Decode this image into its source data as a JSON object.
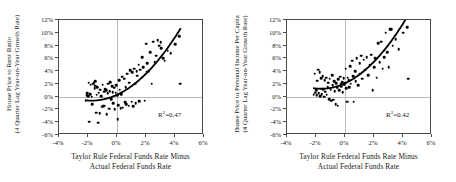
{
  "figure": {
    "background": "#ffffff",
    "point_color": "#000000",
    "curve_color": "#000000",
    "grid_color": "#b9b9b9",
    "frame_color": "#4a4a4a"
  },
  "charts": [
    {
      "id": "house-price-to-rent-ratio",
      "type": "scatter",
      "title": "",
      "ylabel_line1": "House Price to Rent Ratio",
      "ylabel_line2": "(4 Quarter Lag Year-on-Year Growth Rate)",
      "xlabel_line1": "Taylor Rule Federal Funds Rate Minus",
      "xlabel_line2": "Actual Federal Funds Rate",
      "xlim": [
        -4,
        6
      ],
      "ylim": [
        -6,
        12
      ],
      "xticks": [
        "-4%",
        "-2%",
        "0%",
        "2%",
        "4%",
        "6%"
      ],
      "xtick_values": [
        -4,
        -2,
        0,
        2,
        4,
        6
      ],
      "yticks": [
        "12%",
        "10%",
        "8%",
        "6%",
        "4%",
        "2%",
        "0%",
        "-2%",
        "-4%",
        "-6%"
      ],
      "ytick_values": [
        12,
        10,
        8,
        6,
        4,
        2,
        0,
        -2,
        -4,
        -6
      ],
      "grid": "zero-lines-only",
      "annotation": "R",
      "annotation_sup": "2",
      "annotation_value": "=0.47",
      "fit": {
        "type": "quadratic",
        "a": 0.3,
        "b": 1.05,
        "c": 0.3,
        "x_start": -2.2,
        "x_end": 4.4
      },
      "points": [
        [
          -2.15,
          -0.6
        ],
        [
          -2.1,
          0.2
        ],
        [
          -2.05,
          0.5
        ],
        [
          -2.0,
          0.1
        ],
        [
          -1.95,
          2.2
        ],
        [
          -1.9,
          -3.9
        ],
        [
          -1.85,
          0.4
        ],
        [
          -1.8,
          1.9
        ],
        [
          -1.75,
          0.0
        ],
        [
          -1.7,
          -1.2
        ],
        [
          -1.65,
          2.0
        ],
        [
          -1.6,
          2.1
        ],
        [
          -1.55,
          1.3
        ],
        [
          -1.5,
          2.4
        ],
        [
          -1.5,
          1.7
        ],
        [
          -1.45,
          -2.5
        ],
        [
          -1.4,
          0.3
        ],
        [
          -1.35,
          1.5
        ],
        [
          -1.3,
          -4.1
        ],
        [
          -1.25,
          0.6
        ],
        [
          -1.2,
          -2.6
        ],
        [
          -1.15,
          1.1
        ],
        [
          -1.1,
          0.1
        ],
        [
          -1.05,
          -1.6
        ],
        [
          -1.0,
          1.9
        ],
        [
          -0.95,
          -1.5
        ],
        [
          -0.9,
          0.8
        ],
        [
          -0.85,
          -1.4
        ],
        [
          -0.8,
          1.2
        ],
        [
          -0.75,
          1.0
        ],
        [
          -0.7,
          -2.7
        ],
        [
          -0.65,
          0.5
        ],
        [
          -0.6,
          2.0
        ],
        [
          -0.55,
          -1.9
        ],
        [
          -0.5,
          0.9
        ],
        [
          -0.45,
          2.3
        ],
        [
          -0.4,
          -0.4
        ],
        [
          -0.35,
          1.6
        ],
        [
          -0.3,
          0.7
        ],
        [
          -0.25,
          -1.0
        ],
        [
          -0.2,
          1.4
        ],
        [
          -0.15,
          -2.0
        ],
        [
          -0.1,
          0.6
        ],
        [
          -0.05,
          1.8
        ],
        [
          0.0,
          0.2
        ],
        [
          0.05,
          -3.5
        ],
        [
          0.1,
          -1.3
        ],
        [
          0.15,
          2.6
        ],
        [
          0.2,
          1.1
        ],
        [
          0.25,
          -1.8
        ],
        [
          0.3,
          0.4
        ],
        [
          0.35,
          3.1
        ],
        [
          0.4,
          -1.7
        ],
        [
          0.5,
          2.8
        ],
        [
          0.55,
          -0.9
        ],
        [
          0.6,
          1.5
        ],
        [
          0.65,
          -1.2
        ],
        [
          0.7,
          3.6
        ],
        [
          0.8,
          -1.4
        ],
        [
          0.85,
          2.2
        ],
        [
          0.9,
          4.1
        ],
        [
          1.0,
          -0.8
        ],
        [
          1.05,
          3.8
        ],
        [
          1.1,
          -1.5
        ],
        [
          1.2,
          4.4
        ],
        [
          1.25,
          2.0
        ],
        [
          1.3,
          -1.0
        ],
        [
          1.35,
          4.0
        ],
        [
          1.4,
          3.3
        ],
        [
          1.5,
          5.0
        ],
        [
          1.55,
          -0.7
        ],
        [
          1.6,
          4.2
        ],
        [
          1.7,
          3.0
        ],
        [
          1.75,
          6.2
        ],
        [
          1.8,
          4.6
        ],
        [
          1.9,
          -0.6
        ],
        [
          2.0,
          8.3
        ],
        [
          2.05,
          3.9
        ],
        [
          2.1,
          5.2
        ],
        [
          2.2,
          4.0
        ],
        [
          2.3,
          7.0
        ],
        [
          2.4,
          2.0
        ],
        [
          2.5,
          8.6
        ],
        [
          2.6,
          5.4
        ],
        [
          2.7,
          6.4
        ],
        [
          2.8,
          8.8
        ],
        [
          2.9,
          8.0
        ],
        [
          3.0,
          8.5
        ],
        [
          3.05,
          7.6
        ],
        [
          3.2,
          6.0
        ],
        [
          3.3,
          5.6
        ],
        [
          3.5,
          7.2
        ],
        [
          3.7,
          6.8
        ],
        [
          4.0,
          8.2
        ],
        [
          4.3,
          9.5
        ],
        [
          4.35,
          2.0
        ]
      ]
    },
    {
      "id": "house-price-to-personal-income-per-capita",
      "type": "scatter",
      "title": "",
      "ylabel_line1": "House Price to Personal Income Per Capita",
      "ylabel_line2": "(4 Quarter Lag Year-on-Year Growth Rate)",
      "xlabel_line1": "Taylor Rule Federal Funds Rate Minus",
      "xlabel_line2": "Actual Federal Funds Rate",
      "xlim": [
        -4,
        6
      ],
      "ylim": [
        -6,
        12
      ],
      "xticks": [
        "-4%",
        "-2%",
        "0%",
        "2%",
        "4%",
        "6%"
      ],
      "xtick_values": [
        -4,
        -2,
        0,
        2,
        4,
        6
      ],
      "yticks": [
        "12%",
        "10%",
        "8%",
        "6%",
        "4%",
        "2%",
        "0%",
        "-2%",
        "-4%",
        "-6%"
      ],
      "ytick_values": [
        12,
        10,
        8,
        6,
        4,
        2,
        0,
        -2,
        -4,
        -6
      ],
      "grid": "zero-lines-only",
      "annotation": "R",
      "annotation_sup": "2",
      "annotation_value": "=0.42",
      "fit": {
        "type": "quadratic",
        "a": 0.32,
        "b": 1.05,
        "c": 2.1,
        "x_start": -2.2,
        "x_end": 4.4
      },
      "points": [
        [
          -2.15,
          0.3
        ],
        [
          -2.1,
          3.6
        ],
        [
          -2.05,
          0.6
        ],
        [
          -2.0,
          1.0
        ],
        [
          -1.95,
          0.2
        ],
        [
          -1.9,
          2.5
        ],
        [
          -1.85,
          4.2
        ],
        [
          -1.8,
          0.5
        ],
        [
          -1.75,
          3.8
        ],
        [
          -1.7,
          0.1
        ],
        [
          -1.65,
          2.9
        ],
        [
          -1.6,
          0.4
        ],
        [
          -1.55,
          3.2
        ],
        [
          -1.5,
          1.2
        ],
        [
          -1.45,
          0.0
        ],
        [
          -1.4,
          2.6
        ],
        [
          -1.35,
          0.8
        ],
        [
          -1.3,
          3.0
        ],
        [
          -1.25,
          0.3
        ],
        [
          -1.2,
          1.5
        ],
        [
          -1.15,
          2.2
        ],
        [
          -1.1,
          -0.4
        ],
        [
          -1.05,
          2.8
        ],
        [
          -1.0,
          1.1
        ],
        [
          -0.95,
          -0.6
        ],
        [
          -0.9,
          3.4
        ],
        [
          -0.85,
          1.8
        ],
        [
          -0.8,
          -0.5
        ],
        [
          -0.75,
          2.4
        ],
        [
          -0.7,
          0.9
        ],
        [
          -0.65,
          -1.2
        ],
        [
          -0.6,
          2.1
        ],
        [
          -0.55,
          1.4
        ],
        [
          -0.5,
          -1.4
        ],
        [
          -0.45,
          2.7
        ],
        [
          -0.4,
          1.0
        ],
        [
          -0.35,
          3.1
        ],
        [
          -0.3,
          2.0
        ],
        [
          -0.25,
          1.6
        ],
        [
          -0.2,
          2.3
        ],
        [
          -0.15,
          0.7
        ],
        [
          -0.1,
          2.9
        ],
        [
          -0.05,
          1.9
        ],
        [
          0.0,
          2.2
        ],
        [
          0.05,
          4.4
        ],
        [
          0.1,
          1.3
        ],
        [
          0.15,
          -0.8
        ],
        [
          0.2,
          3.0
        ],
        [
          0.25,
          2.6
        ],
        [
          0.3,
          1.5
        ],
        [
          0.35,
          4.8
        ],
        [
          0.4,
          2.0
        ],
        [
          0.5,
          5.6
        ],
        [
          0.55,
          3.2
        ],
        [
          0.6,
          -0.8
        ],
        [
          0.7,
          4.0
        ],
        [
          0.75,
          2.4
        ],
        [
          0.8,
          6.0
        ],
        [
          0.9,
          1.8
        ],
        [
          1.0,
          5.2
        ],
        [
          1.05,
          3.6
        ],
        [
          1.1,
          6.4
        ],
        [
          1.2,
          2.8
        ],
        [
          1.3,
          5.8
        ],
        [
          1.4,
          4.2
        ],
        [
          1.5,
          6.2
        ],
        [
          1.6,
          3.4
        ],
        [
          1.7,
          5.0
        ],
        [
          1.8,
          6.6
        ],
        [
          1.9,
          1.0
        ],
        [
          2.0,
          4.6
        ],
        [
          2.1,
          6.0
        ],
        [
          2.2,
          3.0
        ],
        [
          2.3,
          8.4
        ],
        [
          2.4,
          5.4
        ],
        [
          2.5,
          8.6
        ],
        [
          2.6,
          4.4
        ],
        [
          2.7,
          6.2
        ],
        [
          2.8,
          10.0
        ],
        [
          2.9,
          7.0
        ],
        [
          3.0,
          4.6
        ],
        [
          3.1,
          10.6
        ],
        [
          3.2,
          10.6
        ],
        [
          3.3,
          8.0
        ],
        [
          3.5,
          9.0
        ],
        [
          3.7,
          7.4
        ],
        [
          4.0,
          10.0
        ],
        [
          4.3,
          10.9
        ],
        [
          4.35,
          2.8
        ]
      ]
    }
  ]
}
